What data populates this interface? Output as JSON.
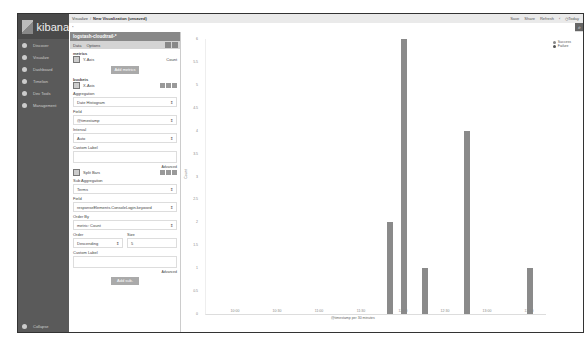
{
  "app": {
    "logo_text": "kibana"
  },
  "sidebar": {
    "items": [
      {
        "label": "Discover",
        "icon": "compass-icon"
      },
      {
        "label": "Visualize",
        "icon": "bar-chart-icon"
      },
      {
        "label": "Dashboard",
        "icon": "dashboard-icon"
      },
      {
        "label": "Timelion",
        "icon": "timelion-icon"
      },
      {
        "label": "Dev Tools",
        "icon": "wrench-icon"
      },
      {
        "label": "Management",
        "icon": "gear-icon"
      }
    ],
    "collapse_label": "Collapse"
  },
  "topbar": {
    "breadcrumb_root": "Visualize",
    "breadcrumb_sep": "/",
    "breadcrumb_current": "New Visualization (unsaved)",
    "actions": [
      "Save",
      "Share",
      "Refresh"
    ],
    "time_picker": "Today"
  },
  "query": {
    "value": "*",
    "search_icon": "search-icon"
  },
  "editor": {
    "index_pattern": "logstash-cloudtrail-*",
    "tabs": [
      "Data",
      "Options"
    ],
    "metrics_title": "metrics",
    "y_axis_label": "Y-Axis",
    "y_axis_value": "Count",
    "add_metrics": "Add metrics",
    "buckets_title": "buckets",
    "x_axis_label": "X-Axis",
    "aggregation_label": "Aggregation",
    "aggregation_value": "Date Histogram",
    "field_label": "Field",
    "field_value": "@timestamp",
    "interval_label": "Interval",
    "interval_value": "Auto",
    "custom_label": "Custom Label",
    "advanced": "Advanced",
    "split_label": "Split Bars",
    "sub_agg_label": "Sub Aggregation",
    "sub_agg_value": "Terms",
    "field2_label": "Field",
    "field2_value": "responseElements.ConsoleLogin.keyword",
    "order_by_label": "Order By",
    "order_by_value": "metric: Count",
    "order_label": "Order",
    "size_label": "Size",
    "order_value": "Descending",
    "size_value": "5",
    "custom_label2": "Custom Label",
    "advanced2": "Advanced",
    "add_sub_buckets": "Add sub-buckets"
  },
  "chart_data": {
    "type": "bar",
    "title": "",
    "xlabel": "@timestamp per 30 minutes",
    "ylabel": "Count",
    "ylim": [
      0,
      6
    ],
    "yticks": [
      "6",
      "5.5",
      "5",
      "4.5",
      "4",
      "3.5",
      "3",
      "2.5",
      "2",
      "1.5",
      "1",
      "0.5",
      "0"
    ],
    "xticks": [
      "10:00",
      "10:30",
      "11:00",
      "11:30",
      "12:00",
      "12:30",
      "13:00",
      "13:30"
    ],
    "legend": [
      "Success",
      "Failure"
    ],
    "bars": [
      {
        "x": "11:50",
        "value": 2
      },
      {
        "x": "12:00",
        "value": 6
      },
      {
        "x": "12:15",
        "value": 1
      },
      {
        "x": "12:45",
        "value": 4
      },
      {
        "x": "13:30",
        "value": 1
      }
    ]
  }
}
